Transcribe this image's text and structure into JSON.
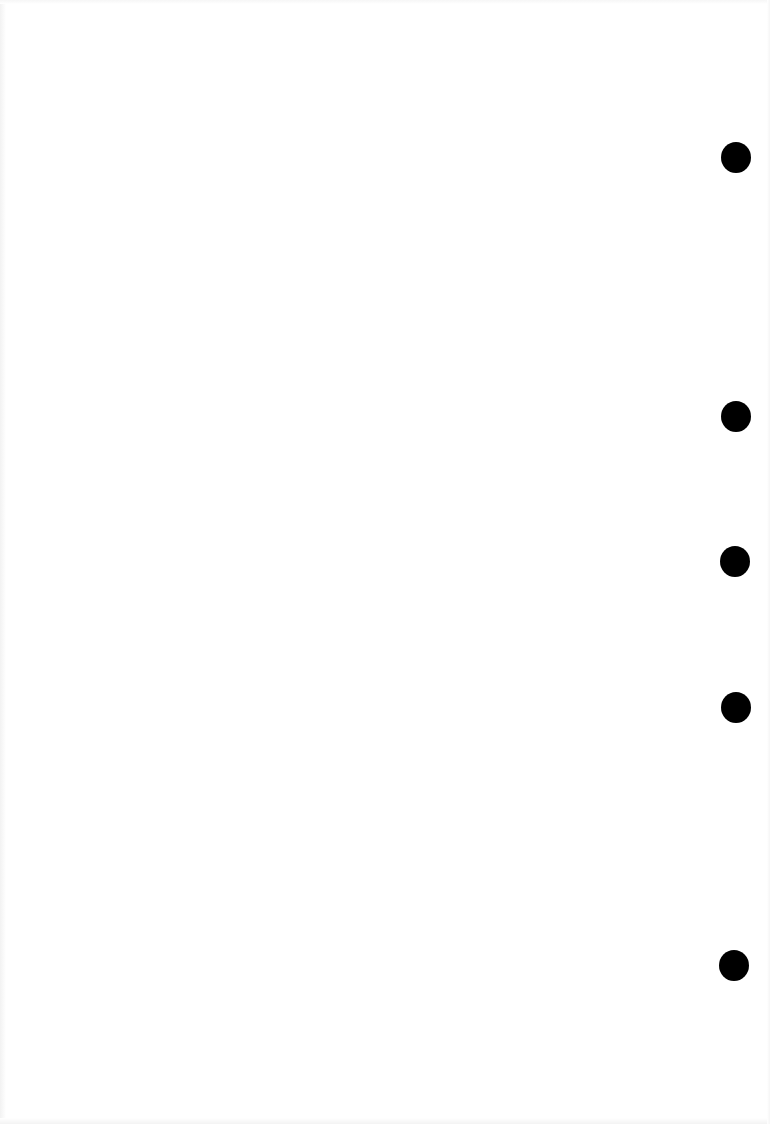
{
  "document": {
    "type": "blank scanned page",
    "text": "",
    "background_color": "#ffffff"
  },
  "punch_holes": {
    "color": "#000000",
    "items": [
      {
        "x": 736,
        "y": 157
      },
      {
        "x": 736,
        "y": 416
      },
      {
        "x": 735,
        "y": 561
      },
      {
        "x": 736,
        "y": 707
      },
      {
        "x": 734,
        "y": 965
      }
    ]
  }
}
